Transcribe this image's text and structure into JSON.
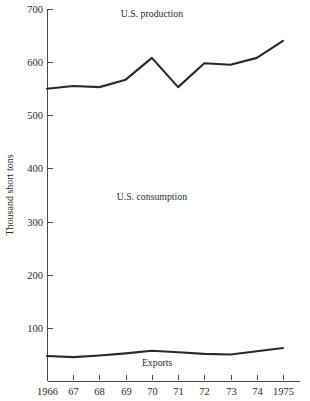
{
  "chart_data": {
    "type": "line",
    "title": "",
    "xlabel": "",
    "ylabel": "Thousand short tons",
    "ylim": [
      0,
      700
    ],
    "xlim": [
      1966,
      1975
    ],
    "grid": false,
    "legend_position": "inline-annotations",
    "x": [
      1966,
      1967,
      1968,
      1969,
      1970,
      1971,
      1972,
      1973,
      1974,
      1975
    ],
    "xtick_labels": [
      "1966",
      "67",
      "68",
      "69",
      "70",
      "71",
      "72",
      "73",
      "74",
      "1975"
    ],
    "ytick_labels": [
      "100",
      "200",
      "300",
      "400",
      "500",
      "600",
      "700"
    ],
    "ytick_values": [
      100,
      200,
      300,
      400,
      500,
      600,
      700
    ],
    "series": [
      {
        "name": "U.S. production",
        "values": [
          550,
          555,
          553,
          567,
          608,
          553,
          598,
          595,
          608,
          640
        ]
      },
      {
        "name": "Exports",
        "values": [
          47,
          45,
          48,
          52,
          57,
          54,
          51,
          50,
          56,
          62
        ]
      }
    ],
    "annotations": [
      {
        "text": "U.S. production",
        "x": 1970.0,
        "y": 685
      },
      {
        "text": "U.S. consumption",
        "x": 1970.0,
        "y": 340
      },
      {
        "text": "Exports",
        "x": 1970.2,
        "y": 28
      }
    ]
  },
  "colors": {
    "line": "#2a2a2a",
    "axis": "#4a4a4a",
    "text": "#2b2b2b",
    "background": "#ffffff"
  }
}
